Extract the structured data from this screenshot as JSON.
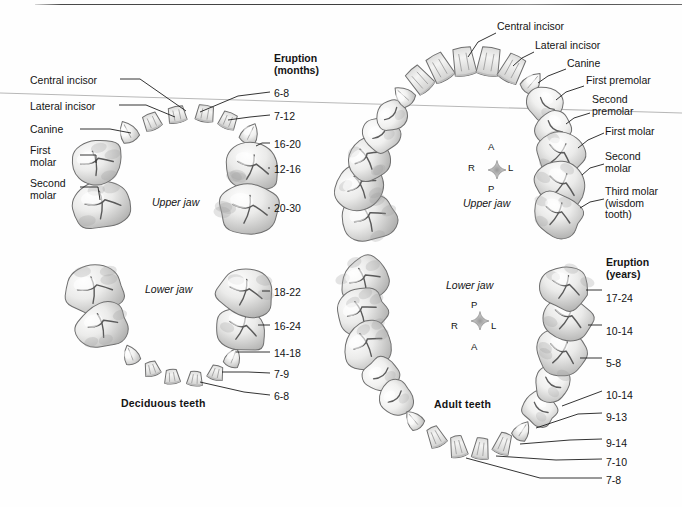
{
  "figure": {
    "top_rule": true,
    "scan_artifact_line": true
  },
  "panels": {
    "deciduous": {
      "caption": "Deciduous teeth",
      "upper_jaw_label": "Upper jaw",
      "lower_jaw_label": "Lower jaw",
      "eruption_header_line1": "Eruption",
      "eruption_header_line2": "(months)",
      "tooth_labels": [
        "Central incisor",
        "Lateral incisor",
        "Canine",
        "First\nmolar",
        "Second\nmolar"
      ],
      "upper_eruption": [
        "6-8",
        "7-12",
        "16-20",
        "12-16",
        "20-30"
      ],
      "lower_eruption": [
        "18-22",
        "16-24",
        "14-18",
        "7-9",
        "6-8"
      ]
    },
    "adult": {
      "caption": "Adult teeth",
      "upper_jaw_label": "Upper jaw",
      "lower_jaw_label": "Lower jaw",
      "eruption_header_line1": "Eruption",
      "eruption_header_line2": "(years)",
      "tooth_labels": [
        "Central incisor",
        "Lateral incisor",
        "Canine",
        "First premolar",
        "Second\npremolar",
        "First molar",
        "Second\nmolar",
        "Third molar\n(wisdom\ntooth)"
      ],
      "lower_eruption": [
        "17-24",
        "10-14",
        "5-8",
        "10-14",
        "9-13",
        "9-14",
        "7-10",
        "7-8"
      ]
    }
  },
  "compass_upper": {
    "top": "A",
    "bottom": "P",
    "left": "R",
    "right": "L"
  },
  "compass_lower": {
    "top": "P",
    "bottom": "A",
    "left": "R",
    "right": "L"
  },
  "colors": {
    "background": "#fefefe",
    "ink": "#141414",
    "leader": "#1d1d1d",
    "tooth_fill": "#f3f3f2",
    "tooth_shade": "#bdbdbd",
    "tooth_outline": "#6d6d6d",
    "artifact": "#b4b4b4"
  }
}
